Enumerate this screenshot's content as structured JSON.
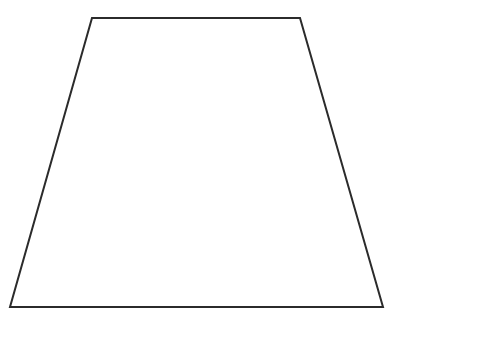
{
  "canvas": {
    "width": 482,
    "height": 359,
    "background_color": "#ffffff"
  },
  "figure": {
    "name": "trapezoid",
    "kind": "isosceles-trapezoid",
    "stroke_color": "#2b2b2b",
    "stroke_width": 2,
    "fill_color": "none",
    "vertices": [
      {
        "label": "top-left",
        "x": 92,
        "y": 18
      },
      {
        "label": "top-right",
        "x": 300,
        "y": 18
      },
      {
        "label": "bottom-right",
        "x": 383,
        "y": 307
      },
      {
        "label": "bottom-left",
        "x": 10,
        "y": 307
      }
    ],
    "points_attr": "92,18 300,18 383,307 10,307",
    "edges": [
      {
        "name": "top-base",
        "from": "top-left",
        "to": "top-right",
        "length_px": 208
      },
      {
        "name": "right-leg",
        "from": "top-right",
        "to": "bottom-right",
        "length_px": 301
      },
      {
        "name": "bottom-base",
        "from": "bottom-right",
        "to": "bottom-left",
        "length_px": 373
      },
      {
        "name": "left-leg",
        "from": "bottom-left",
        "to": "top-left",
        "length_px": 300
      }
    ],
    "metrics": {
      "top_base_px": 208,
      "bottom_base_px": 373,
      "height_px": 289
    },
    "labels": []
  }
}
